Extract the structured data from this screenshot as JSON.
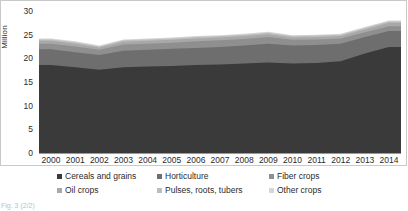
{
  "chart_data": {
    "type": "area",
    "stacked": true,
    "title": "",
    "xlabel": "",
    "ylabel": "Million",
    "ylim": [
      0,
      30
    ],
    "yticks": [
      30,
      25,
      20,
      15,
      10,
      5,
      0
    ],
    "grid": true,
    "legend_position": "bottom",
    "categories": [
      "2000",
      "2001",
      "2002",
      "2003",
      "2004",
      "2005",
      "2006",
      "2007",
      "2008",
      "2009",
      "2010",
      "2011",
      "2012",
      "2013",
      "2014"
    ],
    "series": [
      {
        "name": "Cereals and grains",
        "color": "#3a3a3a",
        "values": [
          18.6,
          18.1,
          17.6,
          18.1,
          18.3,
          18.4,
          18.6,
          18.7,
          18.9,
          19.1,
          18.9,
          19.0,
          19.4,
          21.0,
          22.4
        ]
      },
      {
        "name": "Horticulture",
        "color": "#6e6e6e",
        "values": [
          3.3,
          3.2,
          3.1,
          3.5,
          3.5,
          3.6,
          3.6,
          3.7,
          3.8,
          4.0,
          3.8,
          3.8,
          3.7,
          3.5,
          3.4
        ]
      },
      {
        "name": "Fiber crops",
        "color": "#8f8f8f",
        "values": [
          1.2,
          1.2,
          1.1,
          1.3,
          1.3,
          1.3,
          1.4,
          1.4,
          1.4,
          1.4,
          1.2,
          1.2,
          1.1,
          1.0,
          1.0
        ]
      },
      {
        "name": "Oil crops",
        "color": "#a8a8a8",
        "values": [
          0.6,
          0.6,
          0.5,
          0.6,
          0.6,
          0.6,
          0.6,
          0.6,
          0.6,
          0.6,
          0.5,
          0.5,
          0.5,
          0.6,
          0.7
        ]
      },
      {
        "name": "Pulses, roots, tubers",
        "color": "#bdbdbd",
        "values": [
          0.3,
          0.3,
          0.2,
          0.3,
          0.3,
          0.3,
          0.3,
          0.3,
          0.3,
          0.3,
          0.3,
          0.3,
          0.3,
          0.3,
          0.3
        ]
      },
      {
        "name": "Other crops",
        "color": "#d6d6d6",
        "values": [
          0.2,
          0.2,
          0.2,
          0.2,
          0.2,
          0.2,
          0.2,
          0.2,
          0.2,
          0.2,
          0.2,
          0.2,
          0.2,
          0.2,
          0.2
        ]
      }
    ],
    "totals": [
      24.2,
      23.6,
      22.7,
      24.0,
      24.2,
      24.4,
      24.7,
      24.9,
      25.2,
      25.6,
      24.9,
      25.0,
      25.2,
      26.6,
      28.0
    ]
  },
  "axis": {
    "ylabel": "Million",
    "yticks": [
      "30",
      "25",
      "20",
      "15",
      "10",
      "5",
      "0"
    ]
  },
  "legend": {
    "items": [
      {
        "label": "Cereals and grains",
        "color": "#3a3a3a"
      },
      {
        "label": "Horticulture",
        "color": "#6e6e6e"
      },
      {
        "label": "Fiber crops",
        "color": "#8f8f8f"
      },
      {
        "label": "Oil crops",
        "color": "#a8a8a8"
      },
      {
        "label": "Pulses, roots, tubers",
        "color": "#bdbdbd"
      },
      {
        "label": "Other crops",
        "color": "#d6d6d6"
      }
    ]
  },
  "caption": {
    "text": "Fig. 3 (2/2)"
  }
}
